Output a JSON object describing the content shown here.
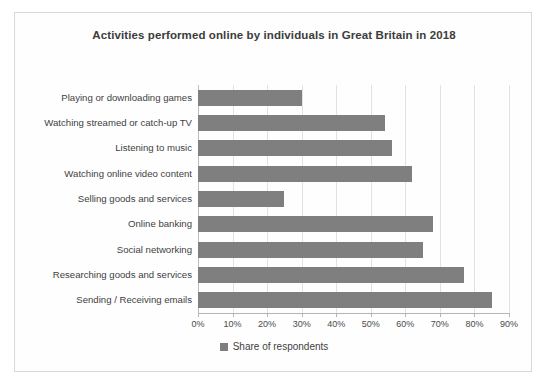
{
  "chart": {
    "title": "Activities performed online by individuals in Great Britain in 2018",
    "legend_label": "Share of respondents",
    "bar_color": "#7f7f7f",
    "grid_color": "#e2e2e2",
    "axis_color": "#b5b5b5",
    "title_color": "#3c3c3c",
    "label_color": "#3f3f3f"
  },
  "chart_data": {
    "type": "bar",
    "orientation": "horizontal",
    "title": "Activities performed online by individuals in Great Britain in 2018",
    "xlabel": "",
    "ylabel": "",
    "xlim": [
      0,
      90
    ],
    "xtick_labels": [
      "0%",
      "10%",
      "20%",
      "30%",
      "40%",
      "50%",
      "60%",
      "70%",
      "80%",
      "90%"
    ],
    "xticks": [
      0,
      10,
      20,
      30,
      40,
      50,
      60,
      70,
      80,
      90
    ],
    "grid": true,
    "legend_position": "bottom",
    "categories": [
      "Playing or downloading games",
      "Watching streamed or catch-up TV",
      "Listening to music",
      "Watching online video content",
      "Selling goods and services",
      "Online banking",
      "Social networking",
      "Researching goods and services",
      "Sending / Receiving emails"
    ],
    "series": [
      {
        "name": "Share of respondents",
        "values": [
          30,
          54,
          56,
          62,
          25,
          68,
          65,
          77,
          85
        ]
      }
    ]
  }
}
